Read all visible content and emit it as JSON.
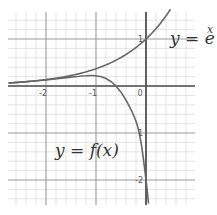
{
  "chart_data": {
    "type": "line",
    "title": "",
    "xlabel": "",
    "ylabel": "",
    "xlim": [
      -2.75,
      0.98
    ],
    "ylim": [
      -2.5,
      1.55
    ],
    "grid": true,
    "minor_grid_per_unit": 5,
    "x_ticks": [
      {
        "value": -2,
        "label": "-2"
      },
      {
        "value": -1,
        "label": "-1"
      },
      {
        "value": 0,
        "label": "0"
      }
    ],
    "y_ticks": [
      {
        "value": 1,
        "label": "1"
      },
      {
        "value": -1,
        "label": "1"
      },
      {
        "value": -2,
        "label": "-2"
      }
    ],
    "series": [
      {
        "name": "y = e^x",
        "label_main": "y = e",
        "label_sup": "x",
        "x": [
          -2.75,
          -2.5,
          -2,
          -1.5,
          -1,
          -0.5,
          0,
          0.25,
          0.5
        ],
        "y": [
          0.064,
          0.082,
          0.135,
          0.223,
          0.368,
          0.607,
          1.0,
          1.284,
          1.55
        ]
      },
      {
        "name": "y = f(x)",
        "label_main": "y = f(x)",
        "x": [
          -2.75,
          -2.5,
          -2,
          -1.5,
          -1.2,
          -1,
          -0.8,
          -0.6,
          -0.4,
          -0.2,
          -0.1,
          0,
          0.05
        ],
        "y": [
          0.064,
          0.082,
          0.13,
          0.19,
          0.22,
          0.22,
          0.16,
          0.0,
          -0.3,
          -0.75,
          -1.2,
          -2.0,
          -2.5
        ]
      }
    ],
    "legend": "inline labels"
  },
  "colors": {
    "curve": "#666666",
    "axis": "#555555",
    "major_grid": "#9a9a9a",
    "minor_grid": "#dcdcdc",
    "text": "#333333"
  }
}
